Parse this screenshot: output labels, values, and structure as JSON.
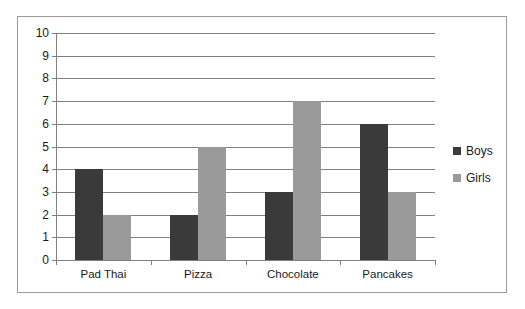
{
  "chart_data": {
    "type": "bar",
    "title": "",
    "xlabel": "",
    "ylabel": "",
    "categories": [
      "Pad Thai",
      "Pizza",
      "Chocolate",
      "Pancakes"
    ],
    "series": [
      {
        "name": "Boys",
        "values": [
          4,
          2,
          3,
          6
        ],
        "color": "#3a3a3a"
      },
      {
        "name": "Girls",
        "values": [
          2,
          5,
          7,
          3
        ],
        "color": "#9a9a9a"
      }
    ],
    "ylim": [
      0,
      10
    ],
    "ytick_labels": [
      "0",
      "1",
      "2",
      "3",
      "4",
      "5",
      "6",
      "7",
      "8",
      "9",
      "10"
    ],
    "grid": true,
    "legend_position": "right"
  },
  "legend": {
    "items": [
      {
        "label": "Boys"
      },
      {
        "label": "Girls"
      }
    ]
  }
}
